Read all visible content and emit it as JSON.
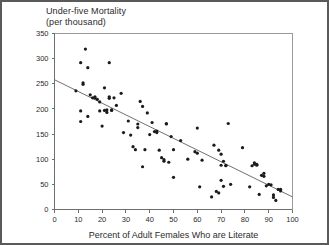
{
  "figure": {
    "border_color": "#5a5a5a",
    "background": "#ffffff"
  },
  "chart_data": {
    "type": "scatter",
    "title": "Under-five Mortality",
    "subtitle": "(per thousand)",
    "xlabel": "Percent of Adult Females Who are Literate",
    "ylabel": "",
    "xlim": [
      0,
      100
    ],
    "ylim": [
      0,
      350
    ],
    "xticks": [
      0,
      10,
      20,
      30,
      40,
      50,
      60,
      70,
      80,
      90,
      100
    ],
    "yticks": [
      0,
      50,
      100,
      150,
      200,
      250,
      300,
      350
    ],
    "grid": false,
    "legend": "none",
    "point_color": "#1a1a1a",
    "point_size": 1.6,
    "trendline": {
      "label": "linear fit",
      "color": "#707070",
      "x": [
        0,
        100
      ],
      "y": [
        258,
        25
      ]
    },
    "points": [
      [
        9,
        236
      ],
      [
        11,
        292
      ],
      [
        11,
        175
      ],
      [
        11,
        196
      ],
      [
        12,
        249
      ],
      [
        12,
        252
      ],
      [
        13,
        319
      ],
      [
        14,
        282
      ],
      [
        14,
        185
      ],
      [
        15,
        228
      ],
      [
        16,
        222
      ],
      [
        17,
        224
      ],
      [
        17,
        222
      ],
      [
        18,
        219
      ],
      [
        19,
        214
      ],
      [
        19,
        196
      ],
      [
        20,
        166
      ],
      [
        21,
        242
      ],
      [
        21,
        197
      ],
      [
        22,
        193
      ],
      [
        22,
        198
      ],
      [
        23,
        221
      ],
      [
        23,
        224
      ],
      [
        23,
        292
      ],
      [
        24,
        197
      ],
      [
        24,
        198
      ],
      [
        25,
        222
      ],
      [
        26,
        207
      ],
      [
        28,
        231
      ],
      [
        29,
        153
      ],
      [
        31,
        176
      ],
      [
        32,
        148
      ],
      [
        33,
        125
      ],
      [
        34,
        119
      ],
      [
        35,
        170
      ],
      [
        35,
        163
      ],
      [
        36,
        215
      ],
      [
        37,
        205
      ],
      [
        37,
        85
      ],
      [
        38,
        119
      ],
      [
        39,
        192
      ],
      [
        40,
        149
      ],
      [
        41,
        173
      ],
      [
        42,
        155
      ],
      [
        43,
        156
      ],
      [
        43,
        153
      ],
      [
        44,
        118
      ],
      [
        45,
        103
      ],
      [
        46,
        99
      ],
      [
        46,
        96
      ],
      [
        47,
        170
      ],
      [
        47,
        171
      ],
      [
        48,
        94
      ],
      [
        49,
        145
      ],
      [
        50,
        119
      ],
      [
        50,
        64
      ],
      [
        53,
        137
      ],
      [
        56,
        100
      ],
      [
        59,
        115
      ],
      [
        60,
        112
      ],
      [
        60,
        162
      ],
      [
        61,
        45
      ],
      [
        62,
        98
      ],
      [
        66,
        25
      ],
      [
        67,
        128
      ],
      [
        68,
        36
      ],
      [
        69,
        33
      ],
      [
        69,
        118
      ],
      [
        70,
        58
      ],
      [
        70,
        110
      ],
      [
        70,
        88
      ],
      [
        71,
        96
      ],
      [
        71,
        46
      ],
      [
        72,
        87
      ],
      [
        72,
        88
      ],
      [
        73,
        171
      ],
      [
        74,
        50
      ],
      [
        79,
        123
      ],
      [
        82,
        45
      ],
      [
        83,
        87
      ],
      [
        84,
        93
      ],
      [
        84,
        90
      ],
      [
        85,
        88
      ],
      [
        85,
        90
      ],
      [
        86,
        30
      ],
      [
        87,
        68
      ],
      [
        88,
        72
      ],
      [
        88,
        66
      ],
      [
        89,
        47
      ],
      [
        90,
        50
      ],
      [
        91,
        49
      ],
      [
        92,
        29
      ],
      [
        92,
        24
      ],
      [
        93,
        18
      ],
      [
        94,
        40
      ],
      [
        95,
        40
      ],
      [
        95,
        37
      ]
    ]
  }
}
